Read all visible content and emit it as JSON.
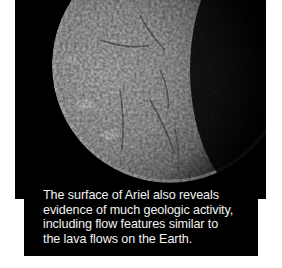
{
  "image": {
    "subject": "moon-ariel",
    "description": "Black-and-white photograph of Ariel's cratered surface, lit from the left with the right side in shadow"
  },
  "caption": {
    "text": "The surface of Ariel also reveals evidence of much geologic activity, including flow features similar to the lava flows on the Earth.",
    "lines": [
      "The surface of Ariel also reveals",
      "evidence of much geologic activity,",
      "including flow features similar to",
      "the lava flows on the Earth."
    ]
  },
  "colors": {
    "panel": "#000000",
    "page": "#ffffff",
    "caption_text": "#f2f2f2"
  }
}
